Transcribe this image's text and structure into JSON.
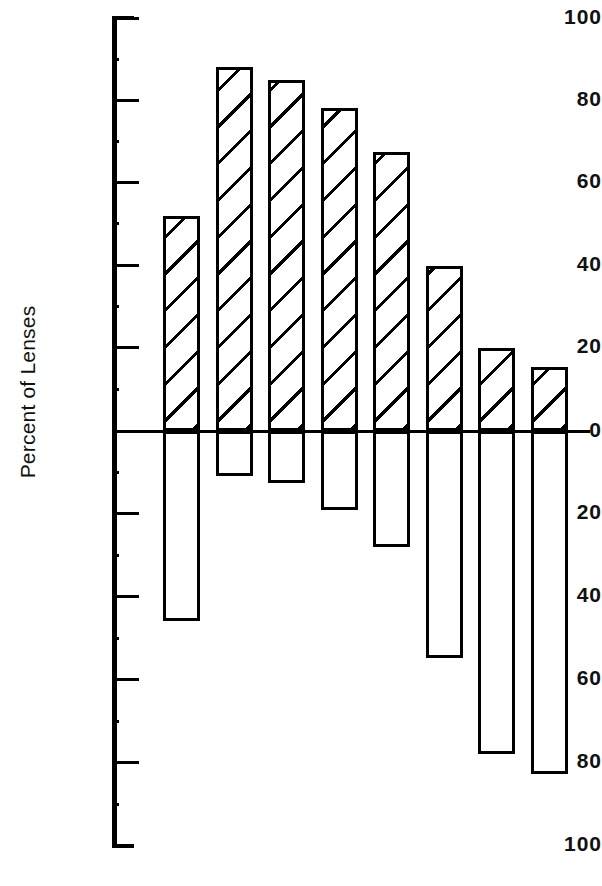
{
  "chart_data": {
    "type": "bar",
    "title": "",
    "xlabel": "",
    "ylabel": "Percent of Lenses",
    "orientation": "vertical",
    "grid": false,
    "legend": null,
    "axis": {
      "y_top_value": 100,
      "y_bottom_value": -100,
      "zero_line": 0,
      "tick_labels_above_zero": [
        "100",
        "80",
        "60",
        "40",
        "20",
        "0"
      ],
      "tick_labels_below_zero": [
        "20",
        "40",
        "60",
        "80",
        "100"
      ],
      "tick_values": [
        100,
        80,
        60,
        40,
        20,
        0,
        -20,
        -40,
        -60,
        -80,
        -100
      ],
      "minor_tick_interval": 10,
      "x_tick_labels": []
    },
    "categories": [
      "1",
      "2",
      "3",
      "4",
      "5",
      "6",
      "7",
      "8"
    ],
    "series": [
      {
        "name": "Positive (above zero)",
        "values": [
          52,
          88,
          85,
          78,
          67.5,
          40,
          20,
          15.5
        ]
      },
      {
        "name": "Negative (below zero)",
        "values": [
          -46,
          -11,
          -12.5,
          -19,
          -28,
          -55,
          -78,
          -83
        ]
      }
    ]
  },
  "axis_labels": {
    "t100a": "100",
    "t80a": "80",
    "t60a": "60",
    "t40a": "40",
    "t20a": "20",
    "t0": "0",
    "t20b": "20",
    "t40b": "40",
    "t60b": "60",
    "t80b": "80",
    "t100b": "100"
  },
  "ylabel_text": "Percent of Lenses",
  "colors": {
    "ink": "#000000",
    "background": "#ffffff"
  }
}
